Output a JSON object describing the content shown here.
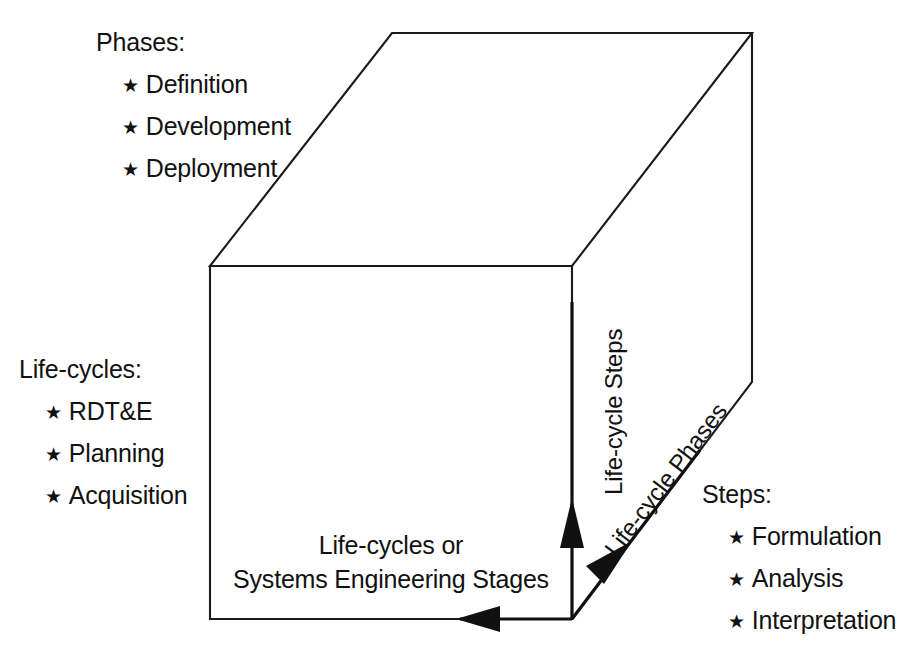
{
  "diagram": {
    "line_color": "#1a1a1a",
    "text_color": "#111111",
    "background_color": "#ffffff"
  },
  "phases_block": {
    "heading": "Phases:",
    "bullet_glyph": "★",
    "items": [
      "Definition",
      "Development",
      "Deployment"
    ]
  },
  "lifecycles_block": {
    "heading": "Life-cycles:",
    "bullet_glyph": "★",
    "items": [
      "RDT&E",
      "Planning",
      "Acquisition"
    ]
  },
  "steps_block": {
    "heading": "Steps:",
    "bullet_glyph": "★",
    "items": [
      "Formulation",
      "Analysis",
      "Interpretation"
    ]
  },
  "front_caption": {
    "line1": "Life-cycles or",
    "line2": "Systems Engineering Stages"
  },
  "axes": {
    "vertical": "Life-cycle Steps",
    "diagonal": "Life-cycle Phases",
    "horizontal": "Life-cycles or Systems Engineering Stages"
  }
}
